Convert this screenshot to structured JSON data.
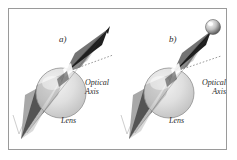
{
  "figure": {
    "background_color": "#ffffff",
    "frame_color": "#9a9a9a",
    "width": 237,
    "height": 160,
    "type": "optics-diagram"
  },
  "panels": [
    {
      "id": "a",
      "letter": "a)",
      "optical_axis_label": "Optical\nAxis",
      "optical_axis_line1": "Optical",
      "optical_axis_line2": "Axis",
      "lens_label": "Lens",
      "tip_type": "sharp-point",
      "cone_color_dark": "#2a2a2a",
      "cone_color_mid": "#6f6f6f",
      "cone_color_light": "#c9c9c9",
      "lens_color": "#d4d4d4"
    },
    {
      "id": "b",
      "letter": "b)",
      "optical_axis_label": "Optical\nAxis",
      "optical_axis_line1": "Optical",
      "optical_axis_line2": "Axis",
      "lens_label": "Lens",
      "tip_type": "sphere-ball",
      "cone_color_dark": "#2a2a2a",
      "cone_color_mid": "#6f6f6f",
      "cone_color_light": "#c9c9c9",
      "lens_color": "#d4d4d4"
    }
  ],
  "colors": {
    "ink": "#2b2b2b",
    "frame": "#9a9a9a",
    "dark_gray": "#2a2a2a",
    "mid_gray": "#6f6f6f",
    "light_gray": "#c9c9c9",
    "lens_fill": "#d4d4d4",
    "page": "#ffffff"
  }
}
